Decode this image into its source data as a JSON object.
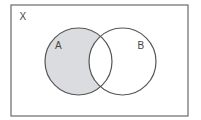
{
  "diagram": {
    "type": "venn",
    "universe": {
      "label": "X",
      "x": 11,
      "y": 5,
      "width": 177,
      "height": 111
    },
    "sets": [
      {
        "id": "A",
        "label": "A",
        "cx": 78.5,
        "cy": 61.5,
        "r": 33.5,
        "label_x": 55,
        "label_y": 48
      },
      {
        "id": "B",
        "label": "B",
        "cx": 122.5,
        "cy": 61.5,
        "r": 33.5,
        "label_x": 137,
        "label_y": 48
      }
    ],
    "shaded_region": "A minus B (A ∩ B')",
    "colors": {
      "stroke": "#555555",
      "shade": "#dbdcdf",
      "background": "#ffffff"
    }
  }
}
